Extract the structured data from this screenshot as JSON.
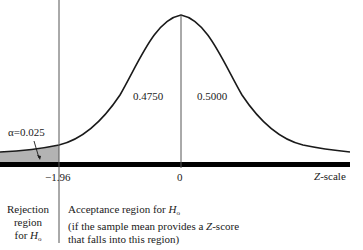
{
  "diagram": {
    "type": "normal-distribution-hypothesis-test",
    "alpha_label": "α=0.025",
    "areas": {
      "left_of_mean": "0.4750",
      "right_of_mean": "0.5000"
    },
    "axis": {
      "critical_value": "−1.96",
      "mean": "0",
      "scale_label": "Z-scale",
      "scale_label_var": "Z",
      "scale_label_rest": "-scale"
    },
    "regions": {
      "rejection": {
        "line1": "Rejection",
        "line2": "region",
        "line3_prefix": "for ",
        "line3_var": "H",
        "line3_sub": "o"
      },
      "acceptance": {
        "line1_prefix": "Acceptance region for ",
        "line1_var": "H",
        "line1_sub": "o",
        "line2_prefix": "(if the sample mean provides a ",
        "line2_var": "Z",
        "line2_suffix": "-score",
        "line3": "that falls into this region)"
      }
    },
    "colors": {
      "curve": "#1a1a1a",
      "axis": "#000000",
      "shade": "#b3b3b3",
      "lines": "#555555"
    }
  }
}
